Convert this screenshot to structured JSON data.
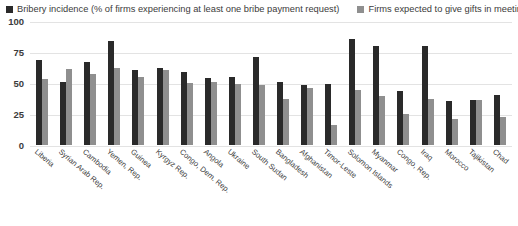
{
  "legend": {
    "items": [
      {
        "label": "Bribery incidence (% of firms experiencing at least one bribe payment request)",
        "color": "#2a2a2a",
        "icon": "square-marker-icon"
      },
      {
        "label": "Firms expected to give gifts in meetings",
        "color": "#8f8f8f",
        "icon": "square-marker-icon"
      }
    ]
  },
  "chart_data": {
    "type": "bar",
    "title": "",
    "subtitle": "",
    "xlabel": "",
    "ylabel": "",
    "ylim": [
      0,
      100
    ],
    "yticks": [
      0,
      25,
      50,
      75,
      100
    ],
    "ytick_labels": [
      "0",
      "25",
      "50",
      "75",
      "100"
    ],
    "grid": true,
    "legend_position": "top",
    "categories": [
      "Liberia",
      "Syrian Arab Rep.",
      "Cambodia",
      "Yemen, Rep.",
      "Guinea",
      "Kyrgyz Rep.",
      "Congo, Dem. Rep.",
      "Angola",
      "Ukraine",
      "South Sudan",
      "Bangladesh",
      "Afghanistan",
      "Timor-Leste",
      "Solomon Islands",
      "Myanmar",
      "Congo, Rep.",
      "Iraq",
      "Morocco",
      "Tajikistan",
      "Chad"
    ],
    "series": [
      {
        "name": "Bribery incidence (% of firms experiencing at least one bribe payment request)",
        "color": "#2a2a2a",
        "values": [
          69,
          52,
          68,
          85,
          61,
          63,
          60,
          55,
          56,
          72,
          52,
          49,
          50,
          86,
          81,
          44,
          81,
          36,
          37,
          41
        ]
      },
      {
        "name": "Firms expected to give gifts in meetings",
        "color": "#8f8f8f",
        "values": [
          54,
          62,
          58,
          63,
          56,
          61,
          51,
          52,
          50,
          49,
          38,
          47,
          17,
          45,
          40,
          26,
          38,
          22,
          37,
          23
        ]
      }
    ]
  }
}
